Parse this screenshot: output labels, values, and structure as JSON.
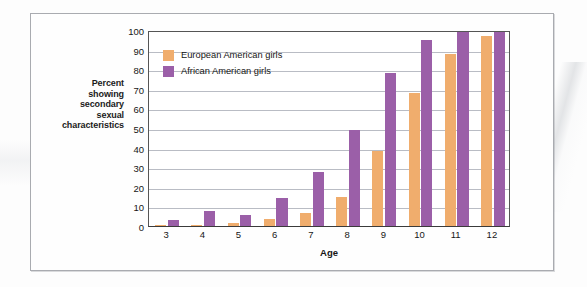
{
  "chart_data": {
    "type": "bar",
    "title": "",
    "xlabel": "Age",
    "ylabel": "Percent showing secondary sexual characteristics",
    "categories": [
      "3",
      "4",
      "5",
      "6",
      "7",
      "8",
      "9",
      "10",
      "11",
      "12"
    ],
    "series": [
      {
        "name": "European American girls",
        "color": "#f0ad6d",
        "values": [
          0.5,
          0.7,
          1.5,
          3.5,
          6.5,
          15,
          38.5,
          68,
          88,
          97
        ]
      },
      {
        "name": "African American girls",
        "color": "#9b5fa8",
        "values": [
          3,
          7.5,
          5.5,
          14.5,
          27.5,
          49,
          78,
          95,
          99,
          100
        ]
      }
    ],
    "ylim": [
      0,
      100
    ],
    "yticks": [
      "0",
      "10",
      "20",
      "30",
      "40",
      "50",
      "60",
      "70",
      "80",
      "90",
      "100"
    ],
    "grid": true,
    "legend_position": "upper-left-inside"
  },
  "axis": {
    "y_caption_lines": [
      "Percent",
      "showing",
      "secondary",
      "sexual",
      "characteristics"
    ],
    "y_caption_text": "Percent showing secondary sexual characteristics",
    "x_title": "Age"
  },
  "legend": {
    "items": [
      {
        "label": "European American girls",
        "key": "eu"
      },
      {
        "label": "African American girls",
        "key": "af"
      }
    ]
  },
  "colors": {
    "european_american": "#f0ad6d",
    "african_american": "#9b5fa8",
    "gridline": "#b9bcc4",
    "axis": "#3b3b3b",
    "frame": "#a9abb0"
  }
}
